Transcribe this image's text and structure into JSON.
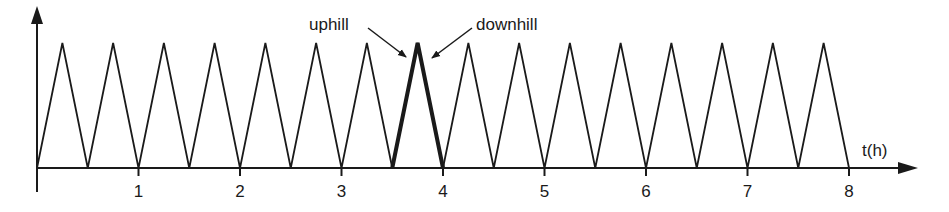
{
  "chart_data": {
    "type": "line",
    "title": "",
    "xlabel": "t(h)",
    "ylabel": "",
    "xlim": [
      0,
      8.6
    ],
    "ylim": [
      0,
      1
    ],
    "grid": false,
    "legend": null,
    "x_ticks": [
      "1",
      "2",
      "3",
      "4",
      "5",
      "6",
      "7",
      "8"
    ],
    "series": [
      {
        "name": "sawtooth cycles",
        "x": [
          0,
          0.25,
          0.5,
          0.75,
          1.0,
          1.25,
          1.5,
          1.75,
          2.0,
          2.25,
          2.5,
          2.75,
          3.0,
          3.25,
          3.5,
          3.75,
          4.0,
          4.25,
          4.5,
          4.75,
          5.0,
          5.25,
          5.5,
          5.75,
          6.0,
          6.25,
          6.5,
          6.75,
          7.0,
          7.25,
          7.5,
          7.75,
          8.0
        ],
        "y": [
          0,
          1,
          0,
          1,
          0,
          1,
          0,
          1,
          0,
          1,
          0,
          1,
          0,
          1,
          0,
          1,
          0,
          1,
          0,
          1,
          0,
          1,
          0,
          1,
          0,
          1,
          0,
          1,
          0,
          1,
          0,
          1,
          0
        ]
      }
    ],
    "highlighted_cycle": {
      "x_start": 3.5,
      "x_peak": 3.75,
      "x_end": 4.0
    },
    "annotations": [
      {
        "text": "uphill",
        "points_to": "rising edge of highlighted cycle (3.5–3.75 h)"
      },
      {
        "text": "downhill",
        "points_to": "falling edge of highlighted cycle (3.75–4.0 h)"
      }
    ]
  },
  "labels": {
    "xlabel": "t(h)",
    "ticks": [
      "1",
      "2",
      "3",
      "4",
      "5",
      "6",
      "7",
      "8"
    ],
    "uphill": "uphill",
    "downhill": "downhill"
  },
  "colors": {
    "line": "#1a1a1a",
    "background": "#ffffff"
  }
}
